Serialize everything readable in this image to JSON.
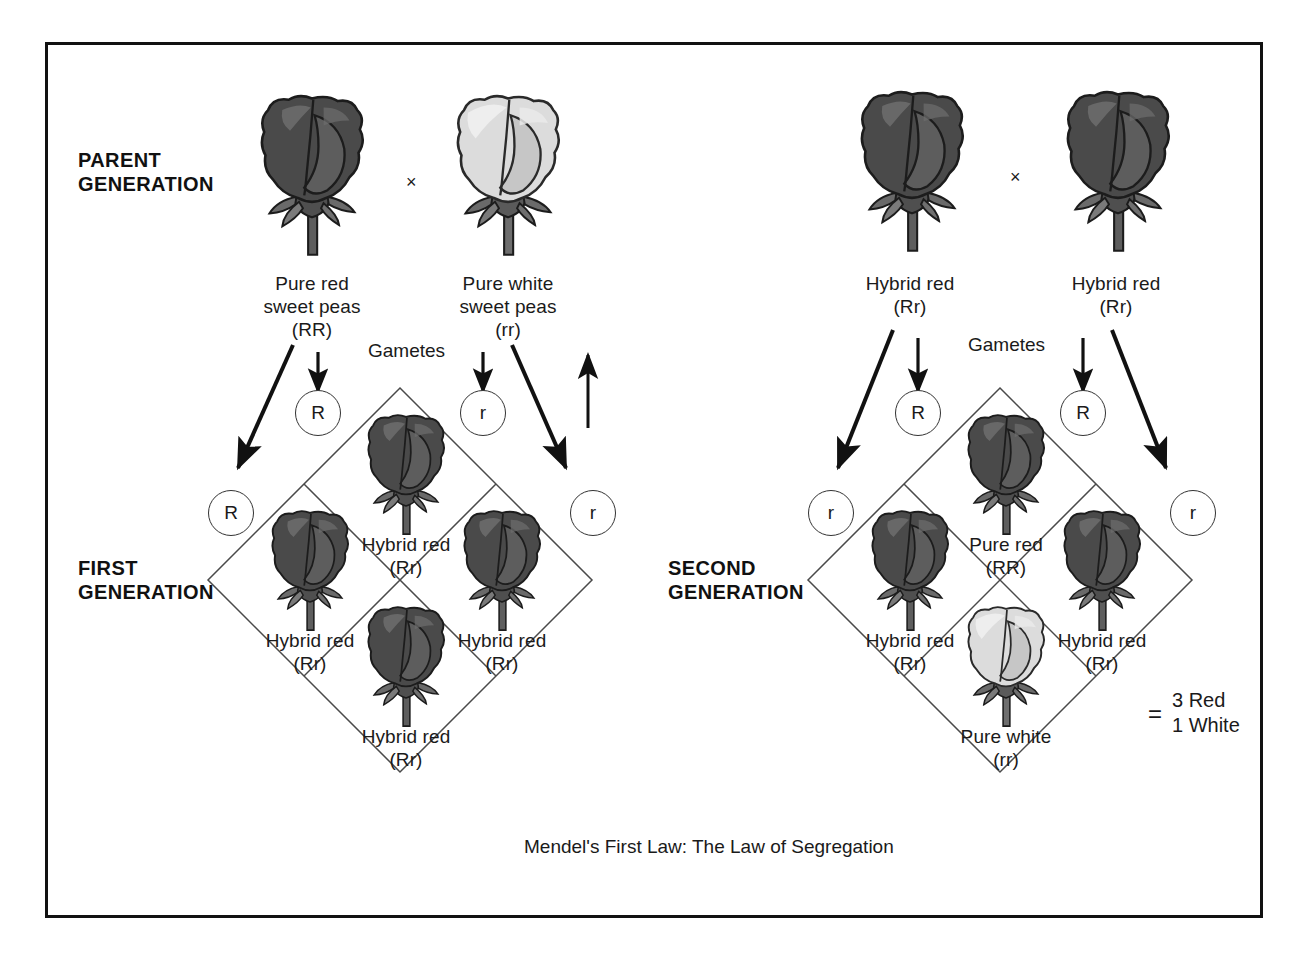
{
  "figure": {
    "caption": "Mendel's First Law: The Law of Segregation",
    "frame_color": "#111111",
    "background": "#ffffff"
  },
  "labels": {
    "parent_generation": "PARENT\nGENERATION",
    "first_generation": "FIRST\nGENERATION",
    "second_generation": "SECOND\nGENERATION",
    "gametes_left": "Gametes",
    "gametes_right": "Gametes",
    "cross_left": "×",
    "cross_right": "×"
  },
  "left_cross": {
    "parents": [
      {
        "name": "Pure red\nsweet peas\n(RR)",
        "phenotype": "Pure red",
        "genotype": "RR",
        "color": "#4a4a4a"
      },
      {
        "name": "Pure white\nsweet peas\n(rr)",
        "phenotype": "Pure white",
        "genotype": "rr",
        "color": "#d4d4d4"
      }
    ],
    "gametes": [
      {
        "allele": "R",
        "position": "inner-left"
      },
      {
        "allele": "r",
        "position": "inner-right"
      },
      {
        "allele": "R",
        "position": "outer-left"
      },
      {
        "allele": "r",
        "position": "outer-right"
      }
    ],
    "offspring": [
      {
        "cell": "top",
        "phenotype": "Hybrid red",
        "genotype": "(Rr)",
        "label": "Hybrid red\n(Rr)",
        "color": "#4a4a4a"
      },
      {
        "cell": "left",
        "phenotype": "Hybrid red",
        "genotype": "(Rr)",
        "label": "Hybrid red\n(Rr)",
        "color": "#4a4a4a"
      },
      {
        "cell": "right",
        "phenotype": "Hybrid red",
        "genotype": "(Rr)",
        "label": "Hybrid red\n(Rr)",
        "color": "#4a4a4a"
      },
      {
        "cell": "bottom",
        "phenotype": "Hybrid red",
        "genotype": "(Rr)",
        "label": "Hybrid red\n(Rr)",
        "color": "#4a4a4a"
      }
    ]
  },
  "right_cross": {
    "parents": [
      {
        "name": "Hybrid red\n(Rr)",
        "phenotype": "Hybrid red",
        "genotype": "Rr",
        "color": "#4a4a4a"
      },
      {
        "name": "Hybrid red\n(Rr)",
        "phenotype": "Hybrid red",
        "genotype": "Rr",
        "color": "#4a4a4a"
      }
    ],
    "gametes": [
      {
        "allele": "R",
        "position": "inner-left"
      },
      {
        "allele": "R",
        "position": "inner-right"
      },
      {
        "allele": "r",
        "position": "outer-left"
      },
      {
        "allele": "r",
        "position": "outer-right"
      }
    ],
    "offspring": [
      {
        "cell": "top",
        "phenotype": "Pure red",
        "genotype": "(RR)",
        "label": "Pure red\n(RR)",
        "color": "#4a4a4a"
      },
      {
        "cell": "left",
        "phenotype": "Hybrid red",
        "genotype": "(Rr)",
        "label": "Hybrid red\n(Rr)",
        "color": "#4a4a4a"
      },
      {
        "cell": "right",
        "phenotype": "Hybrid red",
        "genotype": "(Rr)",
        "label": "Hybrid red\n(Rr)",
        "color": "#4a4a4a"
      },
      {
        "cell": "bottom",
        "phenotype": "Pure white",
        "genotype": "(rr)",
        "label": "Pure white\n(rr)",
        "color": "#d4d4d4"
      }
    ],
    "ratio": {
      "equals": "=",
      "line1": "3 Red",
      "line2": "1 White"
    }
  },
  "icons": {
    "rose_red": "rose-red-icon",
    "rose_white": "rose-white-icon",
    "arrow_down": "arrow-down-icon",
    "arrow_up": "arrow-up-icon",
    "arrow_diagonal": "arrow-diagonal-icon"
  }
}
